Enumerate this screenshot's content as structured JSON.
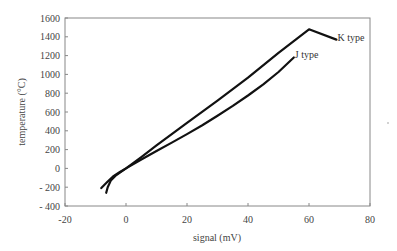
{
  "chart_data": {
    "type": "line",
    "title": "",
    "xlabel": "signal (mV)",
    "ylabel": "temperature (°C)",
    "xlim": [
      -20,
      80
    ],
    "ylim": [
      -400,
      1600
    ],
    "xticks": [
      -20,
      0,
      20,
      40,
      60,
      80
    ],
    "xtick_labels": [
      "-20",
      "0",
      "20",
      "40",
      "60",
      "80"
    ],
    "yticks": [
      -400,
      -200,
      0,
      200,
      400,
      600,
      800,
      1000,
      1200,
      1400,
      1600
    ],
    "ytick_labels": [
      "- 400",
      "- 200",
      "0",
      "200",
      "400",
      "600",
      "800",
      "1000",
      "1200",
      "1400",
      "1600"
    ],
    "grid": false,
    "legend": "inline labels at line ends",
    "series": [
      {
        "name": "J type",
        "label": "J type",
        "color": "#111111",
        "x": [
          -8.1,
          -6,
          -4,
          -2,
          0,
          5,
          10,
          15,
          20,
          25,
          30,
          35,
          40,
          45,
          50,
          55
        ],
        "y": [
          -210,
          -140,
          -80,
          -38,
          0,
          95,
          185,
          275,
          365,
          460,
          560,
          665,
          775,
          895,
          1025,
          1180
        ]
      },
      {
        "name": "K type",
        "label": "K type",
        "color": "#111111",
        "x": [
          -6.5,
          -6,
          -5,
          -3.5,
          -2,
          0,
          5,
          10,
          20,
          30,
          40,
          50,
          60,
          69
        ],
        "y": [
          -260,
          -200,
          -130,
          -80,
          -45,
          0,
          120,
          245,
          485,
          720,
          965,
          1230,
          1480,
          1370
        ]
      }
    ]
  }
}
